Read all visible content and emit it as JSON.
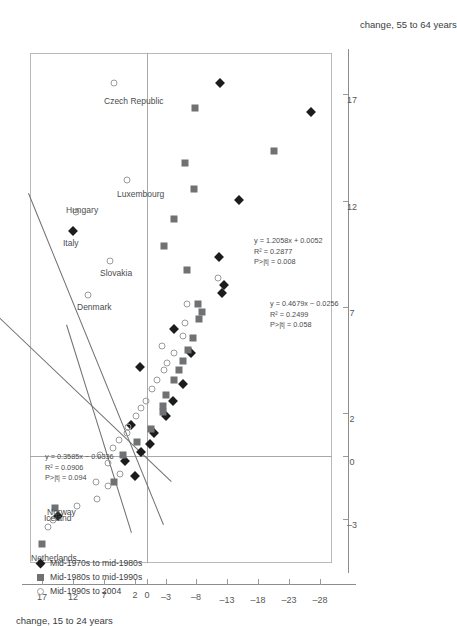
{
  "chart_data": {
    "type": "scatter",
    "title": "",
    "xlabel": "change, 55 to 64 years",
    "ylabel": "change, 15 to 24 years",
    "xlim": [
      -5,
      19
    ],
    "ylim": [
      -30,
      19
    ],
    "xticks": [
      -3,
      0,
      2,
      7,
      12,
      17
    ],
    "yticks": [
      17,
      12,
      7,
      2,
      0,
      -3,
      -8,
      -13,
      -18,
      -23,
      -28
    ],
    "xticklabels": [
      "-3",
      "0",
      "2",
      "7",
      "12",
      "17"
    ],
    "yticklabels": [
      "17",
      "12",
      "7",
      "2",
      "0",
      "-3",
      "-8",
      "-13",
      "-18",
      "-23",
      "-28"
    ],
    "grid": false,
    "zero_reference_lines": {
      "x": 0,
      "y": 0
    },
    "legend_position": "bottom-left",
    "series": [
      {
        "name": "Mid-1970s to mid-1980s",
        "marker": "filled-diamond",
        "color": "#1c1c1c",
        "points": [
          {
            "x": 10.6,
            "y": 12.0,
            "label": "Italy"
          },
          {
            "x": -2.8,
            "y": 14.4,
            "label": "Norway"
          },
          {
            "x": -0.9,
            "y": 2.0
          },
          {
            "x": -0.2,
            "y": 3.6
          },
          {
            "x": 0.2,
            "y": 1.0
          },
          {
            "x": 0.6,
            "y": -0.4
          },
          {
            "x": 1.1,
            "y": -1.2
          },
          {
            "x": 1.5,
            "y": 2.6
          },
          {
            "x": 1.9,
            "y": -3.1
          },
          {
            "x": 2.6,
            "y": -4.2
          },
          {
            "x": 3.4,
            "y": -5.8
          },
          {
            "x": 4.2,
            "y": 1.1
          },
          {
            "x": 4.9,
            "y": -7.2
          },
          {
            "x": 6.0,
            "y": -4.3
          },
          {
            "x": 7.7,
            "y": -12.1
          },
          {
            "x": 8.1,
            "y": -12.5
          },
          {
            "x": 9.4,
            "y": -11.6
          },
          {
            "x": 12.1,
            "y": -14.9
          },
          {
            "x": 16.2,
            "y": -26.6
          },
          {
            "x": 17.6,
            "y": -11.9
          },
          {
            "x": 26.0,
            "y": -14.2
          }
        ]
      },
      {
        "name": "Mid-1980s to mid-1990s",
        "marker": "gray-square",
        "color": "#6f7173",
        "points": [
          {
            "x": -4.1,
            "y": 17.0,
            "label": "Netherlands"
          },
          {
            "x": -2.4,
            "y": 14.9,
            "label": "Iceland"
          },
          {
            "x": -1.2,
            "y": 5.4
          },
          {
            "x": 0.1,
            "y": 3.9
          },
          {
            "x": 0.7,
            "y": 1.6
          },
          {
            "x": 1.3,
            "y": -0.7
          },
          {
            "x": 2.1,
            "y": -2.6
          },
          {
            "x": 2.4,
            "y": -2.6
          },
          {
            "x": 2.9,
            "y": -3.1
          },
          {
            "x": 3.6,
            "y": -4.3
          },
          {
            "x": 4.1,
            "y": -5.1
          },
          {
            "x": 4.5,
            "y": -5.8
          },
          {
            "x": 5.0,
            "y": -6.6
          },
          {
            "x": 5.6,
            "y": -7.5
          },
          {
            "x": 6.5,
            "y": -8.5
          },
          {
            "x": 6.8,
            "y": -8.9
          },
          {
            "x": 7.2,
            "y": -8.2
          },
          {
            "x": 8.8,
            "y": -6.4
          },
          {
            "x": 9.9,
            "y": -2.7
          },
          {
            "x": 11.2,
            "y": -4.3
          },
          {
            "x": 12.6,
            "y": -7.6
          },
          {
            "x": 13.8,
            "y": -6.1
          },
          {
            "x": 14.4,
            "y": -20.6
          },
          {
            "x": 16.4,
            "y": -7.8
          }
        ]
      },
      {
        "name": "Mid-1990s to 2004",
        "marker": "open-circle",
        "color": "#9b9b9b",
        "points": [
          {
            "x": -3.3,
            "y": 16.0
          },
          {
            "x": -3.0,
            "y": 15.2
          },
          {
            "x": -2.3,
            "y": 11.4
          },
          {
            "x": -2.0,
            "y": 8.2
          },
          {
            "x": -1.4,
            "y": 6.3
          },
          {
            "x": -1.2,
            "y": 8.3
          },
          {
            "x": -0.8,
            "y": 4.4
          },
          {
            "x": -0.3,
            "y": 6.4
          },
          {
            "x": 0.1,
            "y": 7.7
          },
          {
            "x": 0.4,
            "y": 5.5
          },
          {
            "x": 0.8,
            "y": 4.6
          },
          {
            "x": 1.1,
            "y": 3.3
          },
          {
            "x": 1.4,
            "y": 3.1
          },
          {
            "x": 1.9,
            "y": 1.8
          },
          {
            "x": 2.3,
            "y": 1.0
          },
          {
            "x": 2.6,
            "y": 0.2
          },
          {
            "x": 3.2,
            "y": -0.8
          },
          {
            "x": 3.6,
            "y": -1.6
          },
          {
            "x": 4.1,
            "y": -2.7
          },
          {
            "x": 4.4,
            "y": -3.3
          },
          {
            "x": 4.9,
            "y": -4.4
          },
          {
            "x": 5.2,
            "y": -2.4
          },
          {
            "x": 5.7,
            "y": -5.9
          },
          {
            "x": 6.3,
            "y": -6.2
          },
          {
            "x": 7.2,
            "y": -6.4
          },
          {
            "x": 7.6,
            "y": 9.6,
            "label": "Denmark"
          },
          {
            "x": 8.4,
            "y": -11.5
          },
          {
            "x": 9.2,
            "y": 6.0,
            "label": "Slovakia"
          },
          {
            "x": 11.5,
            "y": 11.6,
            "label": "Hungary"
          },
          {
            "x": 13.0,
            "y": 3.2,
            "label": "Luxembourg"
          },
          {
            "x": 17.6,
            "y": 5.4,
            "label": "Czech Republic"
          }
        ]
      }
    ],
    "fits": [
      {
        "for_series": "Mid-1990s to 2004",
        "equation": "y = 0.3585x − 0.0336",
        "r2": "R² = 0.0906",
        "p": "P>|t| = 0.094",
        "slope": 0.3585,
        "intercept": -0.0336
      },
      {
        "for_series": "Mid-1980s to mid-1990s",
        "equation": "y = 0.4679x − 0.0256",
        "r2": "R² = 0.2499",
        "p": "P>|t| = 0.058",
        "slope": 0.4679,
        "intercept": -0.0256
      },
      {
        "for_series": "Mid-1970s to mid-1980s",
        "equation": "y = 1.2058x + 0.0052",
        "r2": "R² = 0.2877",
        "p": "P>|t| = 0.008",
        "slope": 1.2058,
        "intercept": 0.0052
      }
    ],
    "annotations": [
      "Netherlands",
      "Iceland",
      "Norway",
      "Denmark",
      "Italy",
      "Hungary",
      "Slovakia",
      "Luxembourg",
      "Czech Republic"
    ]
  },
  "axes": {
    "x_title": "change, 55 to 64 years",
    "y_title": "change, 15 to 24 years"
  },
  "legend": {
    "items": [
      {
        "label": "Mid-1970s to mid-1980s",
        "marker": "filled-diamond"
      },
      {
        "label": "Mid-1980s to mid-1990s",
        "marker": "gray-square"
      },
      {
        "label": "Mid-1990s to 2004",
        "marker": "open-circle"
      }
    ]
  },
  "equations": {
    "fit1": {
      "line1": "y = 0.3585x − 0.0336",
      "line2": "R² = 0.0906",
      "line3": "P>|t| = 0.094"
    },
    "fit2": {
      "line1": "y = 0.4679x − 0.0256",
      "line2": "R² = 0.2499",
      "line3": "P>|t| = 0.058"
    },
    "fit3": {
      "line1": "y = 1.2058x + 0.0052",
      "line2": "R² = 0.2877",
      "line3": "P>|t| = 0.008"
    }
  }
}
